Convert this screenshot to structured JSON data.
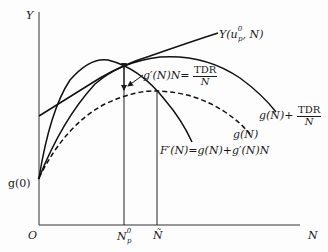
{
  "diagram": {
    "axes": {
      "y_label": "Y",
      "x_label": "N",
      "origin_label": "O"
    },
    "intercept_label": "g(0)",
    "x_markers": [
      {
        "label": "N",
        "sup": "0",
        "sub": "p"
      },
      {
        "label": "Ñ"
      }
    ],
    "curves": [
      {
        "name": "Y(u_p^0, N)",
        "label_prefix": "Y(u",
        "label_sup": "0",
        "label_sub": "p",
        "label_suffix": ", N)",
        "style": "solid"
      },
      {
        "name": "g(N) + TDR/N",
        "label_prefix": "g(N)+",
        "frac_num": "TDR",
        "frac_den": "N",
        "style": "solid"
      },
      {
        "name": "g(N)",
        "label": "g(N)",
        "style": "dashed"
      },
      {
        "name": "F'(N) = g(N) + g'(N)N",
        "label": "F′(N)=g(N)+g′(N)N",
        "style": "solid"
      }
    ],
    "annotation": {
      "prefix": "g′(N)N=",
      "frac_num": "TDR",
      "frac_den": "N"
    }
  }
}
